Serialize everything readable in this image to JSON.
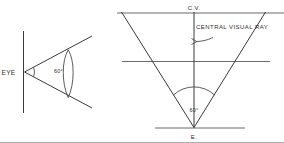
{
  "figure": {
    "ink_color": "#3a3a3a",
    "background_color": "#ffffff"
  },
  "plan_view": {
    "name": "eye-plan-view",
    "eye_label": "EYE",
    "angle_label": "60°"
  },
  "elevation_view": {
    "name": "cone-of-vision-elevation",
    "cv_label": "C.V.",
    "central_visual_ray_label": "CENTRAL VISUAL RAY",
    "angle_label": "60°",
    "station_point_label": "E."
  }
}
